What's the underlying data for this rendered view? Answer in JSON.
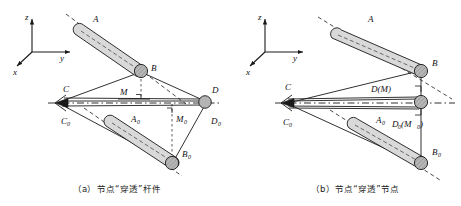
{
  "figure": {
    "panels": [
      {
        "id": "a",
        "caption": "（a）节点“穿透”杆件",
        "axes": {
          "z": "z",
          "y": "y",
          "x": "x"
        },
        "labels": [
          {
            "name": "point-A",
            "text": "A",
            "sub": ""
          },
          {
            "name": "point-B",
            "text": "B",
            "sub": ""
          },
          {
            "name": "point-C",
            "text": "C",
            "sub": ""
          },
          {
            "name": "point-D",
            "text": "D",
            "sub": ""
          },
          {
            "name": "point-M",
            "text": "M",
            "sub": ""
          },
          {
            "name": "point-C0",
            "text": "C",
            "sub": "0"
          },
          {
            "name": "point-D0",
            "text": "D",
            "sub": "0"
          },
          {
            "name": "point-A0",
            "text": "A",
            "sub": "0"
          },
          {
            "name": "point-B0",
            "text": "B",
            "sub": "0"
          },
          {
            "name": "point-M0",
            "text": "M",
            "sub": "0"
          }
        ]
      },
      {
        "id": "b",
        "caption": "（b）节点“穿透”节点",
        "axes": {
          "z": "z",
          "y": "y",
          "x": "x"
        },
        "labels": [
          {
            "name": "point-A",
            "text": "A",
            "sub": ""
          },
          {
            "name": "point-B",
            "text": "B",
            "sub": ""
          },
          {
            "name": "point-C",
            "text": "C",
            "sub": ""
          },
          {
            "name": "point-C0",
            "text": "C",
            "sub": "0"
          },
          {
            "name": "point-A0",
            "text": "A",
            "sub": "0"
          },
          {
            "name": "point-B0",
            "text": "B",
            "sub": "0"
          },
          {
            "name": "point-D-M",
            "text": "D(M)",
            "sub": ""
          },
          {
            "name": "point-D0-M0",
            "text": "D0(M0)",
            "sub": ""
          }
        ]
      }
    ],
    "colors": {
      "line": "#1a1a1a",
      "member_fill": "#d8d8d8",
      "node_fill": "#b4b4b4",
      "dash": "#1a1a1a"
    }
  },
  "text": {
    "axis_z": "z",
    "axis_y": "y",
    "axis_x": "x",
    "A": "A",
    "B": "B",
    "C": "C",
    "D": "D",
    "M": "M",
    "A0_base": "A",
    "B0_base": "B",
    "C0_base": "C",
    "D0_base": "D",
    "M0_base": "M",
    "sub0": "0",
    "D_M": "D(M)",
    "D0_open": "D",
    "D0_mid": "(M",
    "D0_close": ")",
    "caption_a": "（a）节点“穿透”杆件",
    "caption_b": "（b）节点“穿透”节点"
  }
}
